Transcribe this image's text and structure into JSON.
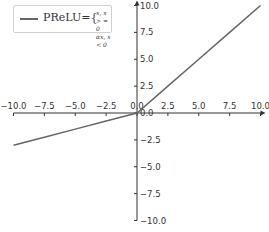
{
  "chart_data": {
    "type": "line",
    "title": "",
    "xlabel": "",
    "ylabel": "",
    "xlim": [
      -10,
      10
    ],
    "ylim": [
      -10,
      10
    ],
    "grid": false,
    "spines": "centered",
    "x_ticks": [
      "-10.0",
      "-7.5",
      "-5.0",
      "-2.5",
      "0.0",
      "2.5",
      "5.0",
      "7.5",
      "10.0"
    ],
    "y_ticks": [
      "10.0",
      "7.5",
      "5.0",
      "2.5",
      "0.0",
      "-2.5",
      "-5.0",
      "-7.5",
      "-10.0"
    ],
    "legend_position": "upper left",
    "series": [
      {
        "name": "PReLU",
        "color": "#666666",
        "alpha_estimate": 0.3,
        "x": [
          -10,
          -7.5,
          -5,
          -2.5,
          0,
          2.5,
          5,
          7.5,
          10
        ],
        "y": [
          -3.0,
          -2.25,
          -1.5,
          -0.75,
          0,
          2.5,
          5,
          7.5,
          10
        ]
      }
    ]
  },
  "legend": {
    "label": "PReLU",
    "equals": "={",
    "case1": "x, x > = 0",
    "case2": "αx, x < 0"
  },
  "colors": {
    "line": "#666666",
    "axis": "#333333"
  }
}
